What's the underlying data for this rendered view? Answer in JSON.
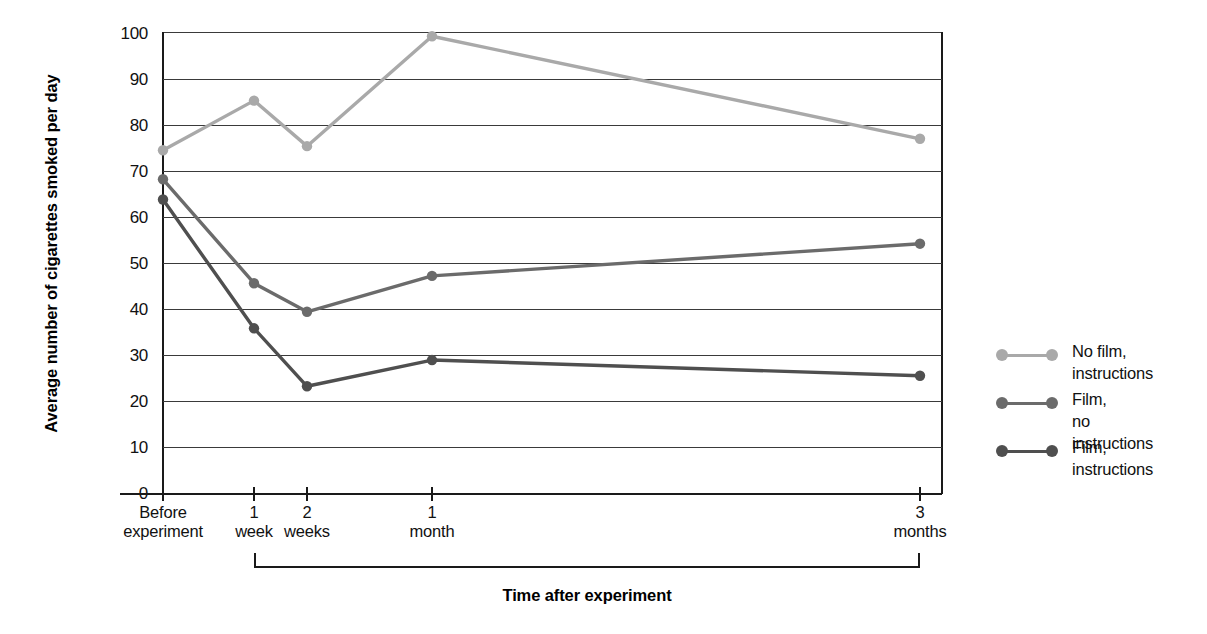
{
  "chart_data": {
    "type": "line",
    "title": "",
    "xlabel": "Time after experiment",
    "ylabel": "Average number of cigarettes\nsmoked per day",
    "ylim": [
      0,
      100
    ],
    "ytick_step": 10,
    "grid": true,
    "legend_position": "right",
    "categories": [
      "Before experiment",
      "1 week",
      "2 weeks",
      "1 month",
      "3 months"
    ],
    "category_labels": [
      {
        "line1": "Before",
        "line2": "experiment"
      },
      {
        "line1": "1",
        "line2": "week"
      },
      {
        "line1": "2",
        "line2": "weeks"
      },
      {
        "line1": "1",
        "line2": "month"
      },
      {
        "line1": "3",
        "line2": "months"
      }
    ],
    "yticks": [
      "0",
      "10",
      "20",
      "30",
      "40",
      "50",
      "60",
      "70",
      "80",
      "90",
      "100"
    ],
    "series": [
      {
        "name": "No film, instructions",
        "legend_line1": "No film,",
        "legend_line2": "instructions",
        "color": "#a9a9a9",
        "values": [
          74.5,
          85.3,
          75.4,
          99.3,
          77.0
        ]
      },
      {
        "name": "Film, no instructions",
        "legend_line1": "Film,",
        "legend_line2": "no instructions",
        "color": "#6b6b6b",
        "values": [
          68.2,
          45.6,
          39.4,
          47.2,
          54.2
        ]
      },
      {
        "name": "Film, instructions",
        "legend_line1": "Film,",
        "legend_line2": "instructions",
        "color": "#4f4f4f",
        "values": [
          63.8,
          35.8,
          23.2,
          28.9,
          25.5
        ]
      }
    ],
    "axis_bracket": {
      "label": "Time after experiment",
      "from": "1 week",
      "to": "3 months"
    }
  }
}
